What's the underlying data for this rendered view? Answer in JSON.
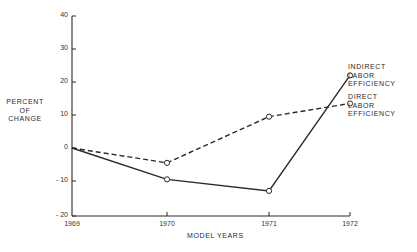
{
  "chart_data": {
    "type": "line",
    "title": "",
    "xlabel": "MODEL YEARS",
    "ylabel": "PERCENT OF CHANGE",
    "ylabel_lines": [
      "PERCENT",
      "OF",
      "CHANGE"
    ],
    "categories": [
      "1969",
      "1970",
      "1971",
      "1972"
    ],
    "x": [
      1969,
      1970,
      1971,
      1972
    ],
    "ylim": [
      -20,
      40
    ],
    "yticks": [
      40,
      30,
      20,
      10,
      0,
      -10,
      -20
    ],
    "ytick_labels": [
      "40",
      "30",
      "20",
      "10",
      "0",
      "- 10",
      "- 20"
    ],
    "grid": false,
    "legend_position": "inline-right",
    "series": [
      {
        "name": "INDIRECT LABOR EFFICIENCY",
        "label_lines": [
          "INDIRECT",
          "LABOR",
          "EFFICIENCY"
        ],
        "style": "solid",
        "values": [
          0,
          -9.5,
          -13,
          22
        ]
      },
      {
        "name": "DIRECT LABOR EFFICIENCY",
        "label_lines": [
          "DIRECT",
          "LABOR",
          "EFFICIENCY"
        ],
        "style": "dashed",
        "values": [
          0,
          -4.5,
          9.5,
          13.5
        ]
      }
    ]
  },
  "colors": {
    "ink": "#2a2a2a",
    "background": "#ffffff"
  }
}
